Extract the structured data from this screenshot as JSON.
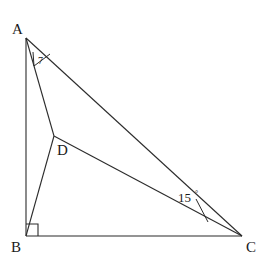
{
  "figure": {
    "background_color": "#ffffff",
    "stroke_color": "#2b2b2b",
    "label_color": "#1a1a1a",
    "stroke_width": 1.1,
    "vertices": [
      {
        "id": "A",
        "label": "A",
        "x": 26,
        "y": 38,
        "label_x": 12,
        "label_y": 34
      },
      {
        "id": "B",
        "label": "B",
        "x": 26,
        "y": 236,
        "label_x": 11,
        "label_y": 252
      },
      {
        "id": "C",
        "label": "C",
        "x": 242,
        "y": 236,
        "label_x": 246,
        "label_y": 252
      },
      {
        "id": "D",
        "label": "D",
        "x": 54,
        "y": 136,
        "label_x": 57,
        "label_y": 155
      }
    ],
    "segments": [
      {
        "id": "AB",
        "from": "A",
        "to": "B"
      },
      {
        "id": "BC",
        "from": "B",
        "to": "C"
      },
      {
        "id": "AC",
        "from": "A",
        "to": "C"
      },
      {
        "id": "AD",
        "from": "A",
        "to": "D"
      },
      {
        "id": "DB",
        "from": "D",
        "to": "B"
      },
      {
        "id": "DC",
        "from": "D",
        "to": "C"
      }
    ],
    "angles": [
      {
        "id": "angle-at-C",
        "vertex": "C",
        "between": [
          "DC",
          "AC"
        ],
        "label": "15",
        "degree_symbol": "°",
        "label_x": 178,
        "label_y": 202,
        "degree_x": 195,
        "degree_y": 196
      },
      {
        "id": "angle-at-A",
        "vertex": "A",
        "between": [
          "AD",
          "AC"
        ],
        "label": "7",
        "label_x": 38,
        "label_y": 62
      },
      {
        "id": "right-angle-at-B",
        "vertex": "B",
        "between": [
          "AB",
          "BC"
        ],
        "label": "right-angle",
        "marker": "square",
        "size": 12
      }
    ]
  }
}
